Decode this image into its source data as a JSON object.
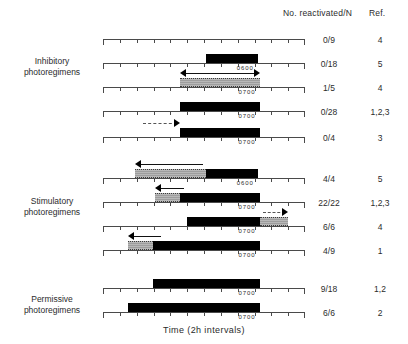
{
  "figure": {
    "xaxis_title": "Time (2h intervals)",
    "columns": {
      "reactivated_header": "No. reactivated/N",
      "ref_header": "Ref."
    },
    "groups": [
      {
        "id": "inhibitory",
        "line1": "Inhibitory",
        "line2": "photoregimens"
      },
      {
        "id": "stimulatory",
        "line1": "Stimulatory",
        "line2": "photoregimens"
      },
      {
        "id": "permissive",
        "line1": "Permissive",
        "line2": "photoregimens"
      }
    ],
    "rows": [
      {
        "id": "row-1",
        "group": "inhibitory",
        "reactivated": "0/9",
        "ref": "4",
        "time_label": ""
      },
      {
        "id": "row-2",
        "group": "inhibitory",
        "reactivated": "0/18",
        "ref": "5",
        "time_label": "0600"
      },
      {
        "id": "row-3",
        "group": "inhibitory",
        "reactivated": "1/5",
        "ref": "4",
        "time_label": "0700"
      },
      {
        "id": "row-4",
        "group": "inhibitory",
        "reactivated": "0/28",
        "ref": "1,2,3",
        "time_label": "0700"
      },
      {
        "id": "row-5",
        "group": "inhibitory",
        "reactivated": "0/4",
        "ref": "3",
        "time_label": "0700"
      },
      {
        "id": "row-6",
        "group": "stimulatory",
        "reactivated": "4/4",
        "ref": "5",
        "time_label": "0600"
      },
      {
        "id": "row-7",
        "group": "stimulatory",
        "reactivated": "22/22",
        "ref": "1,2,3",
        "time_label": "0700"
      },
      {
        "id": "row-8",
        "group": "stimulatory",
        "reactivated": "6/6",
        "ref": "4",
        "time_label": "0700"
      },
      {
        "id": "row-9",
        "group": "stimulatory",
        "reactivated": "4/9",
        "ref": "1",
        "time_label": "0700"
      },
      {
        "id": "row-10",
        "group": "permissive",
        "reactivated": "9/18",
        "ref": "1,2",
        "time_label": "0700"
      },
      {
        "id": "row-11",
        "group": "permissive",
        "reactivated": "6/6",
        "ref": "2",
        "time_label": "0700"
      }
    ]
  },
  "chart_data": {
    "type": "bar",
    "title": "",
    "xlabel": "Time (2h intervals)",
    "ylabel": "",
    "grid": false,
    "legend_position": "none",
    "axis": {
      "units": "2h intervals",
      "tick_count": 13,
      "major_every": 1,
      "x_pixel_start": 103,
      "x_pixel_end": 305,
      "interval_px": 16.83
    },
    "series": [
      {
        "row": "row-1",
        "group": "Inhibitory photoregimens",
        "segments": [],
        "arrows": [],
        "time_label": "",
        "reactivated": "0/9",
        "ref": "4"
      },
      {
        "row": "row-2",
        "group": "Inhibitory photoregimens",
        "segments": [
          {
            "type": "dark",
            "start_interval": 6.1,
            "end_interval": 9.2
          }
        ],
        "arrows": [],
        "time_label": "0600",
        "time_label_interval": 9.2,
        "reactivated": "0/18",
        "ref": "5"
      },
      {
        "row": "row-3",
        "group": "Inhibitory photoregimens",
        "segments": [
          {
            "type": "shade",
            "start_interval": 4.6,
            "end_interval": 9.3
          }
        ],
        "arrows": [
          {
            "type": "double",
            "direction": "both",
            "start_interval": 4.6,
            "end_interval": 9.3,
            "style": "solid"
          }
        ],
        "time_label": "0700",
        "time_label_interval": 9.3,
        "reactivated": "1/5",
        "ref": "4"
      },
      {
        "row": "row-4",
        "group": "Inhibitory photoregimens",
        "segments": [
          {
            "type": "dark",
            "start_interval": 4.6,
            "end_interval": 9.3
          }
        ],
        "arrows": [],
        "time_label": "0700",
        "time_label_interval": 9.3,
        "reactivated": "0/28",
        "ref": "1,2,3"
      },
      {
        "row": "row-5",
        "group": "Inhibitory photoregimens",
        "segments": [
          {
            "type": "dark",
            "start_interval": 4.6,
            "end_interval": 9.3
          }
        ],
        "arrows": [
          {
            "type": "single",
            "direction": "right",
            "start_interval": 2.2,
            "end_interval": 4.6,
            "style": "dashed"
          }
        ],
        "time_label": "0700",
        "time_label_interval": 9.3,
        "reactivated": "0/4",
        "ref": "3"
      },
      {
        "row": "row-6",
        "group": "Stimulatory photoregimens",
        "segments": [
          {
            "type": "shade",
            "start_interval": 1.9,
            "end_interval": 6.1
          },
          {
            "type": "dark",
            "start_interval": 6.1,
            "end_interval": 9.2
          }
        ],
        "arrows": [
          {
            "type": "single",
            "direction": "left",
            "start_interval": 1.9,
            "end_interval": 6.1,
            "style": "solid"
          }
        ],
        "time_label": "0600",
        "time_label_interval": 9.2,
        "reactivated": "4/4",
        "ref": "5"
      },
      {
        "row": "row-7",
        "group": "Stimulatory photoregimens",
        "segments": [
          {
            "type": "shade",
            "start_interval": 3.1,
            "end_interval": 4.6
          },
          {
            "type": "dark",
            "start_interval": 4.6,
            "end_interval": 9.3
          }
        ],
        "arrows": [
          {
            "type": "single",
            "direction": "left",
            "start_interval": 3.1,
            "end_interval": 5.0,
            "style": "solid"
          }
        ],
        "time_label": "0700",
        "time_label_interval": 9.3,
        "reactivated": "22/22",
        "ref": "1,2,3"
      },
      {
        "row": "row-8",
        "group": "Stimulatory photoregimens",
        "segments": [
          {
            "type": "dark",
            "start_interval": 5.0,
            "end_interval": 9.3
          },
          {
            "type": "shade",
            "start_interval": 9.3,
            "end_interval": 11.0
          }
        ],
        "arrows": [
          {
            "type": "single",
            "direction": "right",
            "start_interval": 9.3,
            "end_interval": 11.0,
            "style": "dashed"
          }
        ],
        "time_label": "0700",
        "time_label_interval": 9.3,
        "reactivated": "6/6",
        "ref": "4"
      },
      {
        "row": "row-9",
        "group": "Stimulatory photoregimens",
        "segments": [
          {
            "type": "shade",
            "start_interval": 1.5,
            "end_interval": 3.0
          },
          {
            "type": "dark",
            "start_interval": 3.0,
            "end_interval": 9.3
          }
        ],
        "arrows": [
          {
            "type": "single",
            "direction": "left",
            "start_interval": 1.5,
            "end_interval": 3.6,
            "style": "solid"
          }
        ],
        "time_label": "0700",
        "time_label_interval": 9.3,
        "reactivated": "4/9",
        "ref": "1"
      },
      {
        "row": "row-10",
        "group": "Permissive photoregimens",
        "segments": [
          {
            "type": "dark",
            "start_interval": 3.0,
            "end_interval": 9.3
          }
        ],
        "arrows": [],
        "time_label": "0700",
        "time_label_interval": 9.3,
        "reactivated": "9/18",
        "ref": "1,2"
      },
      {
        "row": "row-11",
        "group": "Permissive photoregimens",
        "segments": [
          {
            "type": "dark",
            "start_interval": 1.5,
            "end_interval": 9.3
          }
        ],
        "arrows": [],
        "time_label": "0700",
        "time_label_interval": 9.3,
        "reactivated": "6/6",
        "ref": "2"
      }
    ]
  }
}
